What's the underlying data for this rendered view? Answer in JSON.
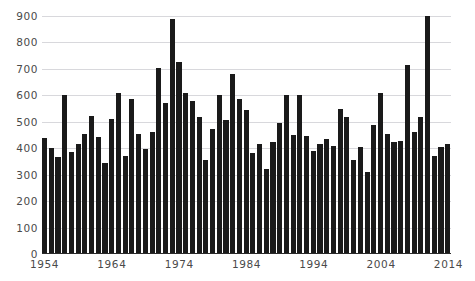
{
  "title_fragment": {
    "part1": "",
    "part2": ""
  },
  "axes": {
    "y_ticks": [
      900,
      800,
      700,
      600,
      500,
      400,
      300,
      200,
      100,
      0
    ],
    "x_ticks": [
      1954,
      1964,
      1974,
      1984,
      1994,
      2004,
      2014
    ],
    "y_min": 0,
    "y_max": 900
  },
  "colors": {
    "bar": "#1a1a1a",
    "gridline": "#d8d8dc",
    "axis": "#2a2a2a",
    "tick_label": "#4a4a4a"
  },
  "chart_data": {
    "type": "bar",
    "title": "",
    "xlabel": "",
    "ylabel": "",
    "ylim": [
      0,
      900
    ],
    "grid": true,
    "legend": "none",
    "categories": [
      "1954",
      "1955",
      "1956",
      "1957",
      "1958",
      "1959",
      "1960",
      "1961",
      "1962",
      "1963",
      "1964",
      "1965",
      "1966",
      "1967",
      "1968",
      "1969",
      "1970",
      "1971",
      "1972",
      "1973",
      "1974",
      "1975",
      "1976",
      "1977",
      "1978",
      "1979",
      "1980",
      "1981",
      "1982",
      "1983",
      "1984",
      "1985",
      "1986",
      "1987",
      "1988",
      "1989",
      "1990",
      "1991",
      "1992",
      "1993",
      "1994",
      "1995",
      "1996",
      "1997",
      "1998",
      "1999",
      "2000",
      "2001",
      "2002",
      "2003",
      "2004",
      "2005",
      "2006",
      "2007",
      "2008",
      "2009",
      "2010",
      "2011",
      "2012",
      "2013",
      "2014"
    ],
    "values": [
      437,
      402,
      367,
      601,
      385,
      415,
      452,
      523,
      443,
      343,
      512,
      609,
      372,
      585,
      454,
      398,
      462,
      703,
      572,
      888,
      727,
      609,
      580,
      520,
      357,
      474,
      603,
      505,
      680,
      588,
      546,
      381,
      416,
      320,
      424,
      494,
      603,
      450,
      603,
      448,
      391,
      415,
      436,
      410,
      549,
      518,
      356,
      406,
      312,
      487,
      607,
      455,
      423,
      427,
      716,
      461,
      520,
      900,
      369,
      406,
      417
    ]
  }
}
